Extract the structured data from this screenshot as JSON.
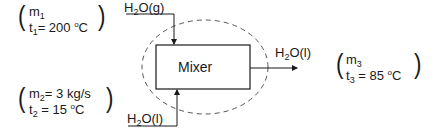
{
  "diagram": {
    "type": "process-mixer",
    "unit": {
      "label": "Mixer"
    },
    "control_volume": {
      "style": "dashed-ellipse"
    },
    "streams": {
      "stream1": {
        "phase_label_main": "H",
        "phase_label_sub": "2",
        "phase_label_rest": "O(g)",
        "m_sym": "m",
        "m_sub": "1",
        "m_val": "",
        "t_sym": "t",
        "t_sub": "1",
        "t_val": "= 200 ",
        "t_deg": "o",
        "t_unit": "C",
        "direction": "in-top"
      },
      "stream2": {
        "phase_label_main": "H",
        "phase_label_sub": "2",
        "phase_label_rest": "O(l)",
        "m_sym": "m",
        "m_sub": "2",
        "m_val": "= 3 kg/s",
        "t_sym": "t",
        "t_sub": "2",
        "t_val": " = 15 ",
        "t_deg": "o",
        "t_unit": "C",
        "direction": "in-bottom"
      },
      "stream3": {
        "phase_label_main": "H",
        "phase_label_sub": "2",
        "phase_label_rest": "O(l)",
        "m_sym": "m",
        "m_sub": "3",
        "m_val": "",
        "t_sym": "t",
        "t_sub": "3",
        "t_val": " = 85 ",
        "t_deg": "o",
        "t_unit": "C",
        "direction": "out-right"
      }
    },
    "parens": {
      "open": "(",
      "close": ")"
    },
    "colors": {
      "line": "#1a1a1a",
      "dashed": "#555555"
    }
  }
}
